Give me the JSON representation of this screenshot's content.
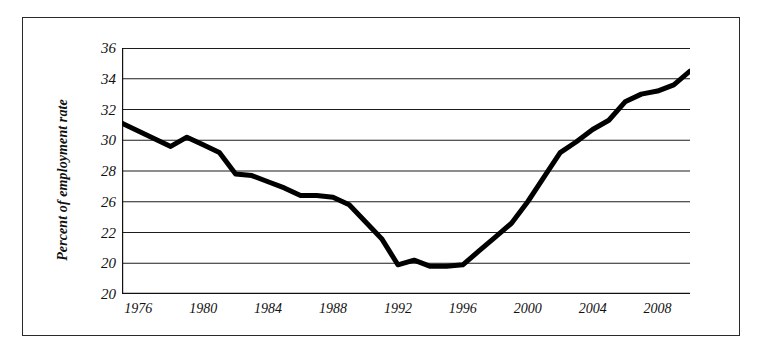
{
  "chart_data": {
    "type": "line",
    "title": "",
    "subtitle": "",
    "xlabel": "",
    "ylabel": "Percent of employment rate",
    "xlim": [
      1975,
      2010
    ],
    "ylim": [
      20,
      36
    ],
    "grid": true,
    "legend": null,
    "gridline_values": [
      36,
      34,
      32,
      30,
      28,
      26,
      24,
      22,
      20
    ],
    "ytick_labels": [
      "36",
      "34",
      "32",
      "30",
      "28",
      "26",
      "22",
      "20"
    ],
    "ytick_values": [
      36,
      34,
      32,
      30,
      28,
      26,
      24,
      22
    ],
    "yaxis_baseline_label": "20",
    "xtick_labels": [
      "1976",
      "1980",
      "1984",
      "1988",
      "1992",
      "1996",
      "2000",
      "2004",
      "2008"
    ],
    "xtick_values": [
      1976,
      1980,
      1984,
      1988,
      1992,
      1996,
      2000,
      2004,
      2008
    ],
    "series": [
      {
        "name": "Percent of employment rate",
        "color": "#000000",
        "x": [
          1975,
          1976,
          1977,
          1978,
          1979,
          1980,
          1981,
          1982,
          1983,
          1984,
          1985,
          1986,
          1987,
          1988,
          1989,
          1990,
          1991,
          1992,
          1993,
          1994,
          1995,
          1996,
          1997,
          1998,
          1999,
          2000,
          2001,
          2002,
          2003,
          2004,
          2005,
          2006,
          2007,
          2008,
          2009,
          2010
        ],
        "values": [
          31.1,
          30.6,
          30.1,
          29.6,
          30.2,
          29.7,
          29.2,
          27.8,
          27.7,
          27.3,
          26.9,
          26.4,
          26.4,
          26.3,
          25.8,
          24.7,
          23.6,
          21.9,
          22.2,
          21.8,
          21.8,
          21.9,
          22.8,
          23.7,
          24.6,
          26.0,
          27.6,
          29.2,
          29.9,
          30.7,
          31.3,
          32.5,
          33.0,
          33.2,
          33.6,
          34.5
        ]
      }
    ]
  }
}
